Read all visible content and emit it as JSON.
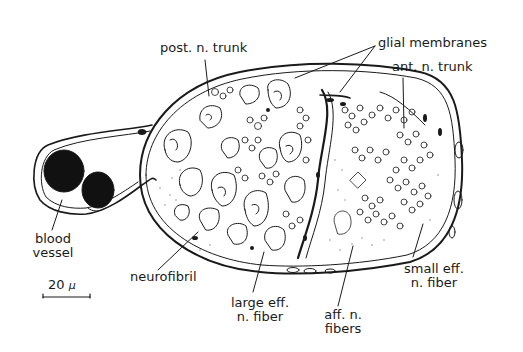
{
  "figure": {
    "labels": {
      "post_n_trunk": "post. n. trunk",
      "glial_membranes": "glial membranes",
      "ant_n_trunk": "ant. n. trunk",
      "blood_vessel_line1": "blood",
      "blood_vessel_line2": "vessel",
      "neurofibril": "neurofibril",
      "large_eff_line1": "large eff.",
      "large_eff_line2": "n. fiber",
      "aff_line1": "aff. n.",
      "aff_line2": "fibers",
      "small_eff_line1": "small eff.",
      "small_eff_line2": "n. fiber"
    },
    "scale_bar": {
      "value": "20",
      "unit": "μ"
    },
    "colors": {
      "ink": "#1a1a1a",
      "background": "#ffffff"
    }
  }
}
